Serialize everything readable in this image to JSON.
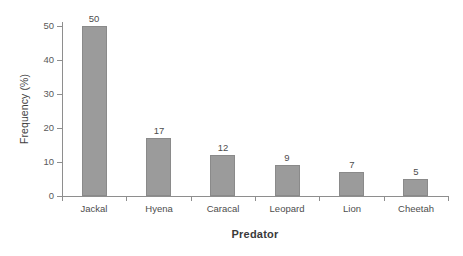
{
  "chart_data": {
    "type": "bar",
    "title": "",
    "subtitle": "",
    "xlabel": "Predator",
    "ylabel": "Frequency (%)",
    "categories": [
      "Jackal",
      "Hyena",
      "Caracal",
      "Leopard",
      "Lion",
      "Cheetah"
    ],
    "values": [
      50,
      17,
      12,
      9,
      7,
      5
    ],
    "data_labels": [
      "50",
      "17",
      "12",
      "9",
      "7",
      "5"
    ],
    "ylim": [
      0,
      52
    ],
    "y_ticks": [
      0,
      10,
      20,
      30,
      40,
      50
    ],
    "y_tick_labels": [
      "0",
      "10",
      "20",
      "30",
      "40",
      "50"
    ],
    "grid": false,
    "legend": "none",
    "bar_color": "#9b9b9b",
    "bar_edge_color": "#8a8a8a",
    "axis_color": "#8e8e8e",
    "text_color": "#4d4d4d",
    "background": "#ffffff"
  }
}
